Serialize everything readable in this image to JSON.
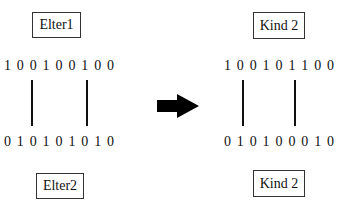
{
  "parent1": {
    "label": "Elter1",
    "bits": [
      "1",
      "0",
      "0",
      "1",
      "0",
      "0",
      "1",
      "0",
      "0"
    ]
  },
  "parent2": {
    "label": "Elter2",
    "bits": [
      "0",
      "1",
      "0",
      "1",
      "0",
      "1",
      "0",
      "1",
      "0"
    ]
  },
  "child_top": {
    "label": "Kind 2",
    "bits": [
      "1",
      "0",
      "0",
      "1",
      "0",
      "1",
      "1",
      "0",
      "0"
    ]
  },
  "child_bottom": {
    "label": "Kind 2",
    "bits": [
      "0",
      "1",
      "0",
      "1",
      "0",
      "0",
      "0",
      "1",
      "0"
    ]
  },
  "arrow": {
    "icon": "right-arrow-icon",
    "color": "#000000"
  },
  "crossover_points": {
    "left": [
      32,
      87
    ],
    "right": [
      243,
      295
    ]
  }
}
